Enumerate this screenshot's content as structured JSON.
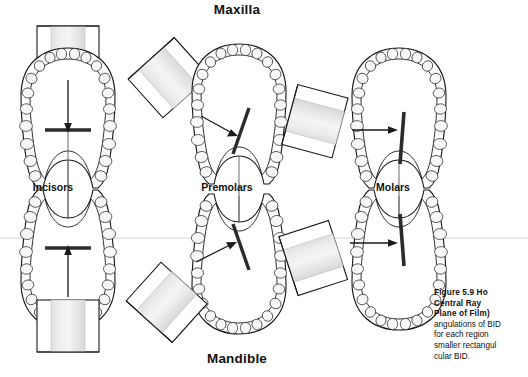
{
  "figure": {
    "headings": {
      "maxilla": "Maxilla",
      "mandible": "Mandible"
    },
    "group_labels": {
      "incisors": "Incisors",
      "premolars": "Premolars",
      "molars": "Molars"
    },
    "caption": {
      "heading_lines": [
        "Figure 5.9 Ho",
        "Central Ray",
        "Plane of Film)"
      ],
      "body_lines": [
        "angulations of BID",
        "for each region",
        "smaller rectangul",
        "cular BID."
      ]
    },
    "colors": {
      "outline": "#1a1a1a",
      "film_bar": "#2b2b2b",
      "bid_fill_light": "#f2f2f2",
      "bid_fill_mid": "#d9d9d9",
      "tooth_fill": "#f7f7f7",
      "ray_line": "#6b6b6b",
      "divider": "#c9d3dd",
      "background": "#ffffff"
    },
    "panels": [
      {
        "id": "maxilla-incisors",
        "arch": "maxilla",
        "region": "Incisors",
        "bid_angle_deg": 0,
        "film_bar_angle_deg": 0,
        "beam_direction": "down"
      },
      {
        "id": "maxilla-premolars",
        "arch": "maxilla",
        "region": "Premolars",
        "bid_angle_deg": 45,
        "film_bar_angle_deg": 20,
        "beam_direction": "down-right"
      },
      {
        "id": "maxilla-molars",
        "arch": "maxilla",
        "region": "Molars",
        "bid_angle_deg": 75,
        "film_bar_angle_deg": 5,
        "beam_direction": "right"
      },
      {
        "id": "mandible-incisors",
        "arch": "mandible",
        "region": "Incisors",
        "bid_angle_deg": 0,
        "film_bar_angle_deg": 0,
        "beam_direction": "up"
      },
      {
        "id": "mandible-premolars",
        "arch": "mandible",
        "region": "Premolars",
        "bid_angle_deg": 40,
        "film_bar_angle_deg": 18,
        "beam_direction": "up-right"
      },
      {
        "id": "mandible-molars",
        "arch": "mandible",
        "region": "Molars",
        "bid_angle_deg": 70,
        "film_bar_angle_deg": 8,
        "beam_direction": "right"
      }
    ]
  }
}
